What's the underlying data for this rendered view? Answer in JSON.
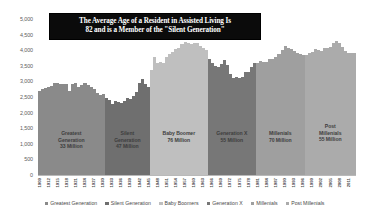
{
  "title": {
    "line1": "The Average Age of a Resident in Assisted Living Is",
    "line2": "82 and is a Member of the \"Silent Generation\"",
    "background": "#0b0b0b",
    "color": "#ffffff"
  },
  "chart_data": {
    "type": "bar",
    "title": "The Average Age of a Resident in Assisted Living Is 82 and is a Member of the \"Silent Generation\"",
    "subtitle": "",
    "xlabel": "",
    "ylabel": "",
    "ylim": [
      0,
      5000
    ],
    "ytick_labels": [
      "5,000",
      "4,500",
      "4,000",
      "3,500",
      "3,000",
      "2,500",
      "2,000",
      "1,500",
      "1,000",
      "500",
      "0"
    ],
    "ytick_values": [
      5000,
      4500,
      4000,
      3500,
      3000,
      2500,
      2000,
      1500,
      1000,
      500,
      0
    ],
    "grid": true,
    "legend_position": "bottom",
    "x_start_year": 1909,
    "x_end_year": 2013,
    "xtick_labels": [
      "1909",
      "1912",
      "1915",
      "1918",
      "1921",
      "1924",
      "1927",
      "1930",
      "1933",
      "1936",
      "1939",
      "1942",
      "1945",
      "1948",
      "1951",
      "1954",
      "1957",
      "1960",
      "1963",
      "1966",
      "1969",
      "1972",
      "1975",
      "1978",
      "1981",
      "1984",
      "1987",
      "1990",
      "1993",
      "1996",
      "1999",
      "2002",
      "2005",
      "2008",
      "2011"
    ],
    "categories": [
      1909,
      1910,
      1911,
      1912,
      1913,
      1914,
      1915,
      1916,
      1917,
      1918,
      1919,
      1920,
      1921,
      1922,
      1923,
      1924,
      1925,
      1926,
      1927,
      1928,
      1929,
      1930,
      1931,
      1932,
      1933,
      1934,
      1935,
      1936,
      1937,
      1938,
      1939,
      1940,
      1941,
      1942,
      1943,
      1944,
      1945,
      1946,
      1947,
      1948,
      1949,
      1950,
      1951,
      1952,
      1953,
      1954,
      1955,
      1956,
      1957,
      1958,
      1959,
      1960,
      1961,
      1962,
      1963,
      1964,
      1965,
      1966,
      1967,
      1968,
      1969,
      1970,
      1971,
      1972,
      1973,
      1974,
      1975,
      1976,
      1977,
      1978,
      1979,
      1980,
      1981,
      1982,
      1983,
      1984,
      1985,
      1986,
      1987,
      1988,
      1989,
      1990,
      1991,
      1992,
      1993,
      1994,
      1995,
      1996,
      1997,
      1998,
      1999,
      2000,
      2001,
      2002,
      2003,
      2004,
      2005,
      2006,
      2007,
      2008,
      2009,
      2010,
      2011,
      2012,
      2013
    ],
    "values": [
      2718,
      2777,
      2809,
      2840,
      2869,
      2966,
      2965,
      2964,
      2944,
      2948,
      2740,
      2950,
      2994,
      2840,
      2909,
      2979,
      2909,
      2839,
      2802,
      2674,
      2582,
      2618,
      2506,
      2440,
      2307,
      2396,
      2377,
      2355,
      2413,
      2496,
      2466,
      2559,
      2703,
      2989,
      3104,
      2939,
      2858,
      3411,
      3817,
      3637,
      3649,
      3632,
      3823,
      3913,
      3965,
      4078,
      4104,
      4218,
      4308,
      4255,
      4245,
      4258,
      4268,
      4167,
      4098,
      4027,
      3760,
      3606,
      3521,
      3502,
      3600,
      3731,
      3556,
      3258,
      3137,
      3160,
      3144,
      3168,
      3327,
      3333,
      3494,
      3612,
      3629,
      3681,
      3639,
      3669,
      3761,
      3757,
      3809,
      3910,
      4041,
      4158,
      4111,
      4065,
      4000,
      3953,
      3900,
      3891,
      3881,
      3942,
      3959,
      4059,
      4026,
      4022,
      4090,
      4112,
      4138,
      4266,
      4316,
      4248,
      4131,
      3999,
      3954,
      3953,
      3932
    ],
    "series": [
      {
        "name": "Greatest Generation",
        "color": "#8a8a8a",
        "start_year": 1909,
        "end_year": 1930,
        "population": "33 Million"
      },
      {
        "name": "Silent Generation",
        "color": "#6f6f6f",
        "start_year": 1931,
        "end_year": 1945,
        "population": "47 Million"
      },
      {
        "name": "Baby Boomers",
        "color": "#bfbfbf",
        "start_year": 1946,
        "end_year": 1964,
        "population": "76 Million"
      },
      {
        "name": "Generation X",
        "color": "#777777",
        "start_year": 1965,
        "end_year": 1980,
        "population": "55 Million"
      },
      {
        "name": "Millenials",
        "color": "#9f9f9f",
        "start_year": 1981,
        "end_year": 1996,
        "population": "70 Million"
      },
      {
        "name": "Post Millenials",
        "color": "#ababab",
        "start_year": 1997,
        "end_year": 2013,
        "population": "55 Million"
      }
    ],
    "annotations": [
      {
        "label": "Greatest Generation",
        "value": "33 Million"
      },
      {
        "label": "Silent Generation",
        "value": "47 Million"
      },
      {
        "label": "Baby Boomer",
        "value": "76 Million"
      },
      {
        "label": "Generation X",
        "value": "55 Million"
      },
      {
        "label": "Millenials",
        "value": "70 Million"
      },
      {
        "label": "Post Millenials",
        "value": "55 Million"
      }
    ]
  },
  "band_labels": [
    {
      "name_l1": "Greatest",
      "name_l2": "Generation",
      "value": "33 Million"
    },
    {
      "name_l1": "Silent",
      "name_l2": "Generation",
      "value": "47 Million"
    },
    {
      "name_l1": "Baby Boomer",
      "name_l2": "",
      "value": "76 Million"
    },
    {
      "name_l1": "Generation X",
      "name_l2": "",
      "value": "55 Million"
    },
    {
      "name_l1": "Millenials",
      "name_l2": "",
      "value": "70 Million"
    },
    {
      "name_l1": "Post",
      "name_l2": "Millenials",
      "value": "55 Million"
    }
  ],
  "legend": [
    {
      "label": "Greatest Generation",
      "color": "#8a8a8a"
    },
    {
      "label": "Silent Generation",
      "color": "#6f6f6f"
    },
    {
      "label": "Baby Boomers",
      "color": "#bfbfbf"
    },
    {
      "label": "Generation X",
      "color": "#777777"
    },
    {
      "label": "Millenials",
      "color": "#9f9f9f"
    },
    {
      "label": "Post Millenials",
      "color": "#ababab"
    }
  ],
  "colors": {
    "plot_background": "#ffffff",
    "gridline": "#e6e6e6",
    "axis_text": "#5c5c5c"
  }
}
